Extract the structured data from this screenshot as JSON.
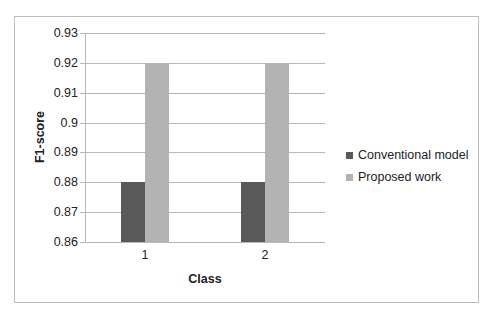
{
  "chart_data": {
    "type": "bar",
    "title": "",
    "xlabel": "Class",
    "ylabel": "F1-score",
    "categories": [
      "1",
      "2"
    ],
    "series": [
      {
        "name": "Conventional model",
        "values": [
          0.88,
          0.88
        ],
        "color": "#595959"
      },
      {
        "name": "Proposed work",
        "values": [
          0.92,
          0.92
        ],
        "color": "#b3b3b3"
      }
    ],
    "ylim": [
      0.86,
      0.93
    ],
    "yticks": [
      "0.93",
      "0.92",
      "0.91",
      "0.9",
      "0.89",
      "0.88",
      "0.87",
      "0.86"
    ],
    "grid": true,
    "legend_position": "right"
  },
  "axes": {
    "xlabel": "Class",
    "ylabel": "F1-score",
    "yticks": [
      "0.93",
      "0.92",
      "0.91",
      "0.9",
      "0.89",
      "0.88",
      "0.87",
      "0.86"
    ],
    "xticks": [
      "1",
      "2"
    ]
  },
  "legend": {
    "items": [
      {
        "label": "Conventional model",
        "color": "#595959"
      },
      {
        "label": "Proposed work",
        "color": "#b3b3b3"
      }
    ]
  }
}
